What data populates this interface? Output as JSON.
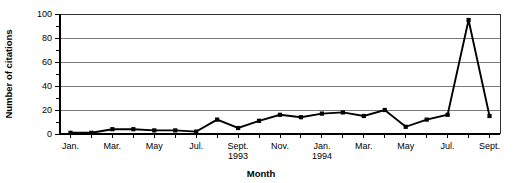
{
  "chart_data": {
    "type": "line",
    "title": "",
    "xlabel": "Month",
    "ylabel": "Number of citations",
    "ylim": [
      0,
      100
    ],
    "ytick_values": [
      0,
      20,
      40,
      60,
      80,
      100
    ],
    "ytick_labels": [
      "0",
      "20",
      "40",
      "60",
      "80",
      "100"
    ],
    "yminor_tick_values": [
      10,
      30,
      50,
      70,
      90
    ],
    "grid": true,
    "grid_axis": "y",
    "legend": "none",
    "marker": "square",
    "line_color": "#000000",
    "marker_color": "#000000",
    "gridline_color": "#6b6b6b",
    "categories": [
      "Jan. 1993",
      "Feb. 1993",
      "Mar. 1993",
      "Apr. 1993",
      "May 1993",
      "Jun. 1993",
      "Jul. 1993",
      "Aug. 1993",
      "Sept. 1993",
      "Oct. 1993",
      "Nov. 1993",
      "Dec. 1993",
      "Jan. 1994",
      "Feb. 1994",
      "Mar. 1994",
      "Apr. 1994",
      "May 1994",
      "Jun. 1994",
      "Jul. 1994",
      "Aug. 1994",
      "Sept. 1994"
    ],
    "values": [
      1,
      1,
      4,
      4,
      3,
      3,
      2,
      12,
      5,
      11,
      16,
      14,
      17,
      18,
      15,
      20,
      6,
      12,
      16,
      95,
      15
    ],
    "xtick_labels": [
      {
        "index": 0,
        "line1": "Jan.",
        "line2": ""
      },
      {
        "index": 2,
        "line1": "Mar.",
        "line2": ""
      },
      {
        "index": 4,
        "line1": "May",
        "line2": ""
      },
      {
        "index": 6,
        "line1": "Jul.",
        "line2": ""
      },
      {
        "index": 8,
        "line1": "Sept.",
        "line2": "1993"
      },
      {
        "index": 10,
        "line1": "Nov.",
        "line2": ""
      },
      {
        "index": 12,
        "line1": "Jan.",
        "line2": "1994"
      },
      {
        "index": 14,
        "line1": "Mar.",
        "line2": ""
      },
      {
        "index": 16,
        "line1": "May",
        "line2": ""
      },
      {
        "index": 18,
        "line1": "Jul.",
        "line2": ""
      },
      {
        "index": 20,
        "line1": "Sept.",
        "line2": ""
      }
    ]
  }
}
